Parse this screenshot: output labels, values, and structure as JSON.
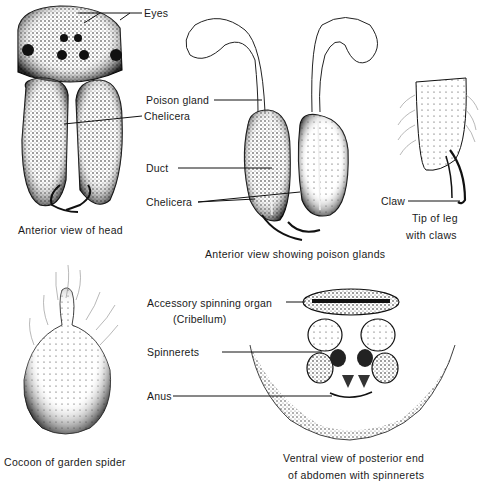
{
  "figures": {
    "head": {
      "caption": "Anterior view of head",
      "labels": {
        "eyes": "Eyes",
        "chelicera": "Chelicera"
      }
    },
    "poison_glands": {
      "caption": "Anterior view showing poison glands",
      "labels": {
        "poison_gland": "Poison gland",
        "duct": "Duct",
        "chelicera": "Chelicera"
      }
    },
    "leg_tip": {
      "caption_line1": "Tip of leg",
      "caption_line2": "with  claws",
      "labels": {
        "claw": "Claw"
      }
    },
    "cocoon": {
      "caption": "Cocoon of garden spider"
    },
    "spinnerets": {
      "caption_line1": "Ventral view of posterior end",
      "caption_line2": "of abdomen with spinnerets",
      "labels": {
        "accessory": "Accessory spinning organ",
        "cribellum": "(Cribellum)",
        "spinnerets": "Spinnerets",
        "anus": "Anus"
      }
    }
  },
  "colors": {
    "ink": "#1a1a1a",
    "background": "#ffffff"
  }
}
